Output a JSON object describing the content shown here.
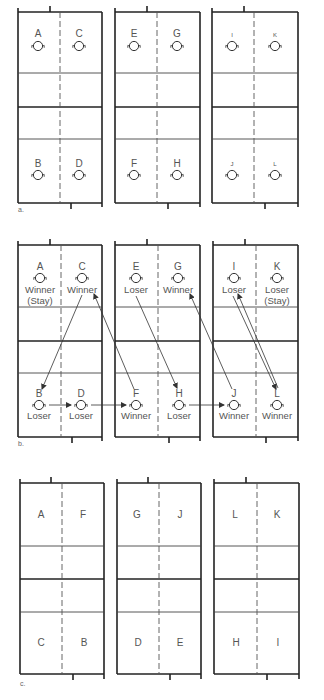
{
  "sections": [
    {
      "caption": "a.",
      "courts": [
        {
          "top_left": "A",
          "top_right": "C",
          "bottom_left": "B",
          "bottom_right": "D"
        },
        {
          "top_left": "E",
          "top_right": "G",
          "bottom_left": "F",
          "bottom_right": "H"
        },
        {
          "top_left": "I",
          "top_right": "K",
          "bottom_left": "J",
          "bottom_right": "L"
        }
      ]
    },
    {
      "caption": "b.",
      "courts": [
        {
          "top_left": "A",
          "top_left_status": "Winner",
          "top_left_note": "(Stay)",
          "top_right": "C",
          "top_right_status": "Winner",
          "bottom_left": "B",
          "bottom_left_status": "Loser",
          "bottom_right": "D",
          "bottom_right_status": "Loser"
        },
        {
          "top_left": "E",
          "top_left_status": "Loser",
          "top_right": "G",
          "top_right_status": "Winner",
          "bottom_left": "F",
          "bottom_left_status": "Winner",
          "bottom_right": "H",
          "bottom_right_status": "Loser"
        },
        {
          "top_left": "I",
          "top_left_status": "Loser",
          "top_right": "K",
          "top_right_status": "Loser",
          "top_right_note": "(Stay)",
          "bottom_left": "J",
          "bottom_left_status": "Winner",
          "bottom_right": "L",
          "bottom_right_status": "Winner"
        }
      ],
      "moves": [
        {
          "from": "C",
          "to": "B"
        },
        {
          "from": "B",
          "to": "D"
        },
        {
          "from": "D",
          "to": "F"
        },
        {
          "from": "F",
          "to": "C"
        },
        {
          "from": "E",
          "to": "H"
        },
        {
          "from": "H",
          "to": "J"
        },
        {
          "from": "J",
          "to": "G"
        },
        {
          "from": "I",
          "to": "L"
        },
        {
          "from": "L",
          "to": "I"
        }
      ]
    },
    {
      "caption": "c.",
      "courts": [
        {
          "top_left": "A",
          "top_right": "F",
          "bottom_left": "C",
          "bottom_right": "B"
        },
        {
          "top_left": "G",
          "top_right": "J",
          "bottom_left": "D",
          "bottom_right": "E"
        },
        {
          "top_left": "L",
          "top_right": "K",
          "bottom_left": "H",
          "bottom_right": "I"
        }
      ]
    }
  ]
}
